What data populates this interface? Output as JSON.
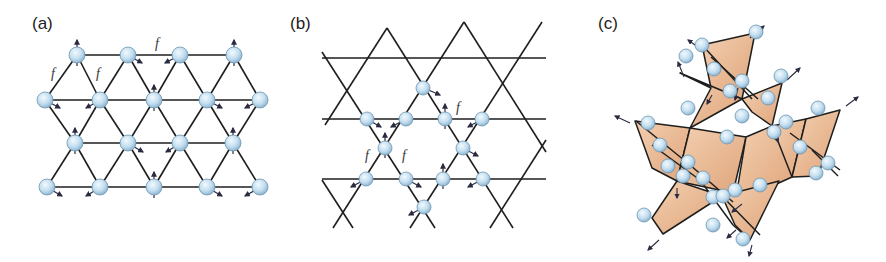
{
  "figure": {
    "panels": [
      {
        "id": "a",
        "label": "(a)",
        "lattice": "triangular",
        "bond_label": "f",
        "bond_label_count": 3
      },
      {
        "id": "b",
        "label": "(b)",
        "lattice": "kagome",
        "bond_label": "f",
        "bond_label_count": 3
      },
      {
        "id": "c",
        "label": "(c)",
        "lattice": "pyrochlore",
        "description": "corner-sharing tetrahedra with spins"
      }
    ]
  },
  "colors": {
    "atom_fill": "#c8e2f2",
    "atom_stroke": "#6e95b0",
    "bond": "#1e1e1e",
    "tetrahedron_fill": "#eab992",
    "arrow": "#2a2a40"
  },
  "symbols": {
    "frustration": "f"
  }
}
